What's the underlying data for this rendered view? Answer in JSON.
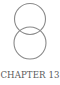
{
  "ornament": {
    "icon": "interlocking-circles-icon",
    "stroke_color": "#8a8a8a",
    "circles": [
      {
        "cx": 30,
        "cy": 19,
        "r": 15.5
      },
      {
        "cx": 30,
        "cy": 43,
        "r": 16
      }
    ]
  },
  "chapter": {
    "label": "CHAPTER 13"
  }
}
